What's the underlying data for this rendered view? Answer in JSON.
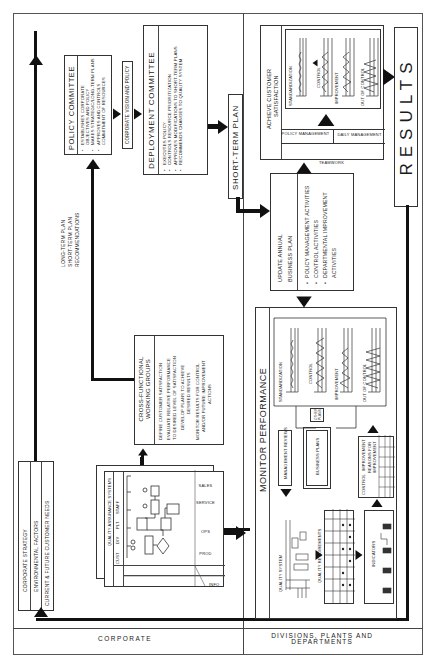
{
  "zones": {
    "corporate": "CORPORATE",
    "divisions_line1": "DIVISIONS, PLANTS AND",
    "divisions_line2": "DEPARTMENTS"
  },
  "inputs": {
    "items": [
      "CORPORATE STRATEGY",
      "ENVIRONMENTAL FACTORS",
      "CURRENT & FUTURE CUSTOMER NEEDS"
    ]
  },
  "policy_committee": {
    "title": "POLICY COMMITTEE",
    "bullets": [
      "ESTABLISHES CORPORATE OBJECTIVES AND POLICY",
      "MAKES STRATEGIC/LONG-TERM PLANS",
      "APPROVES AND CONTROLS COMMITMENT OF RESOURCES"
    ]
  },
  "vision_label": "CORPORATE VISION AND POLICY",
  "deployment_committee": {
    "title": "DEPLOYMENT COMMITTEE",
    "bullets": [
      "EXECUTES POLICY",
      "CONTROLS RESOURCE PRIORITIZATION",
      "APPROVES MODIFICATIONS TO SHORT-TERM PLANS",
      "RECOMMENDS CHANGES TO QUALITY SYSTEM"
    ]
  },
  "short_term_plan": "SHORT-TERM PLAN",
  "recommendations": {
    "lines": [
      "LONG-TERM PLAN",
      "SHORT-TERM PLAN",
      "RECOMMENDATIONS"
    ]
  },
  "cross_functional": {
    "title_line1": "CROSS-FUNCTIONAL",
    "title_line2": "WORKING GROUPS",
    "lines": [
      "DEFINE CUSTOMER SATISFACTION",
      "EVALUATE RELATIVE PERFORMANCE",
      "TO DESIRED LEVEL OF SATISFACTION",
      "DEVELOP PLANS TO ACHIEVE",
      "DESIRED RESULTS",
      "MONITOR RESULTS FOR CONTROL",
      "AND/OR FUTURE IMPROVEMENT",
      "ACTIONS"
    ]
  },
  "qa_systems": {
    "title": "QUALITY ASSURANCE SYSTEMS",
    "columns": [
      "CUST",
      "DIV",
      "PLT",
      "STAFF"
    ],
    "rows": [
      "INFO",
      "PROD",
      "OPS",
      "SERVICE",
      "SALES"
    ]
  },
  "update_plan": {
    "title_line1": "UPDATE ANNUAL",
    "title_line2": "BUSINESS PLAN",
    "bullets": [
      "POLICY MANAGEMENT ACTIVITIES",
      "CONTROL ACTIVITIES",
      "DEPARTMENTAL IMPROVEMENT ACTIVITIES"
    ]
  },
  "achieve": {
    "title_line1": "ACHIEVE CUSTOMER",
    "title_line2": "SATISFACTION",
    "stages": [
      "STANDARDIZATION",
      "CONTROL",
      "IMPROVEMENT",
      "OUT OF CONTROL"
    ],
    "teamwork": "TEAMWORK",
    "policy_mgmt": "POLICY MANAGEMENT",
    "daily_mgmt": "DAILY MANAGEMENT"
  },
  "results": "RESULTS",
  "monitor": {
    "title": "MONITOR PERFORMANCE",
    "stages": [
      "STANDARDIZATION",
      "CONTROL",
      "IMPROVEMENT",
      "OUT OF CONTROL"
    ],
    "management_reviews": "MANAGEMENT REVIEWS",
    "business_plans": "BUSINESS PLANS",
    "other_plans": "OTHER PLANS",
    "control": "CONTROL",
    "improvement": "IMPROVEMENT",
    "reasons_line1": "REASONS FOR",
    "reasons_line2": "IMPROVEMENT",
    "quality_system": "QUALITY SYSTEM",
    "quality_requirements": "QUALITY REQUIREMENTS",
    "indicators": "INDICATORS"
  }
}
